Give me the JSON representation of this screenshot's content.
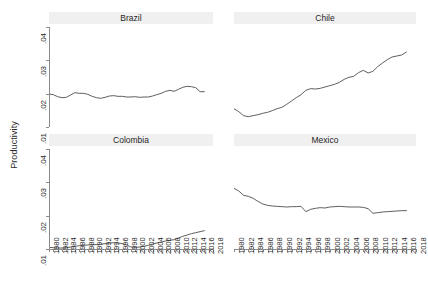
{
  "chart_data": {
    "type": "line",
    "title": "",
    "xlabel": "",
    "ylabel": "Productivity",
    "layout": "2x2 small multiples (faceted by country)",
    "grid": false,
    "legend": "none",
    "xlim": [
      1980,
      2018
    ],
    "ylim": [
      0.01,
      0.04
    ],
    "ytick_labels": [
      ".04",
      ".03",
      ".02",
      ".01"
    ],
    "ytick_values": [
      0.04,
      0.03,
      0.02,
      0.01
    ],
    "xtick_labels": [
      "1980",
      "1982",
      "1984",
      "1986",
      "1988",
      "1990",
      "1992",
      "1994",
      "1996",
      "1998",
      "2000",
      "2002",
      "2004",
      "2006",
      "2008",
      "2010",
      "2012",
      "2014",
      "2016",
      "2018"
    ],
    "x": [
      1980,
      1981,
      1982,
      1983,
      1984,
      1985,
      1986,
      1987,
      1988,
      1989,
      1990,
      1991,
      1992,
      1993,
      1994,
      1995,
      1996,
      1997,
      1998,
      1999,
      2000,
      2001,
      2002,
      2003,
      2004,
      2005,
      2006,
      2007,
      2008,
      2009,
      2010,
      2011,
      2012,
      2013,
      2014,
      2015,
      2016
    ],
    "panels": [
      {
        "name": "Brazil",
        "row": 0,
        "col": 0,
        "x": [
          1980,
          1981,
          1982,
          1983,
          1984,
          1985,
          1986,
          1987,
          1988,
          1989,
          1990,
          1991,
          1992,
          1993,
          1994,
          1995,
          1996,
          1997,
          1998,
          1999,
          2000,
          2001,
          2002,
          2003,
          2004,
          2005,
          2006,
          2007,
          2008,
          2009,
          2010,
          2011,
          2012,
          2013,
          2014,
          2015,
          2016
        ],
        "values": [
          0.0199,
          0.0197,
          0.0191,
          0.0188,
          0.0189,
          0.0196,
          0.0203,
          0.0201,
          0.0201,
          0.0198,
          0.0192,
          0.0188,
          0.0186,
          0.0189,
          0.0193,
          0.0194,
          0.0192,
          0.0192,
          0.019,
          0.019,
          0.0191,
          0.0189,
          0.019,
          0.019,
          0.0193,
          0.0197,
          0.0201,
          0.0207,
          0.021,
          0.0207,
          0.0213,
          0.0219,
          0.0222,
          0.0221,
          0.0218,
          0.0206,
          0.0206
        ]
      },
      {
        "name": "Chile",
        "row": 0,
        "col": 1,
        "x": [
          1980,
          1981,
          1982,
          1983,
          1984,
          1985,
          1986,
          1987,
          1988,
          1989,
          1990,
          1991,
          1992,
          1993,
          1994,
          1995,
          1996,
          1997,
          1998,
          1999,
          2000,
          2001,
          2002,
          2003,
          2004,
          2005,
          2006,
          2007,
          2008,
          2009,
          2010,
          2011,
          2012,
          2013,
          2014,
          2015,
          2016
        ],
        "values": [
          0.0155,
          0.0146,
          0.0134,
          0.0131,
          0.0134,
          0.0137,
          0.0141,
          0.0144,
          0.0149,
          0.0155,
          0.0159,
          0.0168,
          0.0178,
          0.0188,
          0.0197,
          0.021,
          0.0215,
          0.0214,
          0.0216,
          0.022,
          0.0224,
          0.0228,
          0.0234,
          0.0243,
          0.0249,
          0.0252,
          0.0263,
          0.027,
          0.0262,
          0.0267,
          0.0281,
          0.0292,
          0.0302,
          0.031,
          0.0313,
          0.0316,
          0.0325
        ]
      },
      {
        "name": "Colombia",
        "row": 1,
        "col": 0,
        "x": [
          1980,
          1981,
          1982,
          1983,
          1984,
          1985,
          1986,
          1987,
          1988,
          1989,
          1990,
          1991,
          1992,
          1993,
          1994,
          1995,
          1996,
          1997,
          1998,
          1999,
          2000,
          2001,
          2002,
          2003,
          2004,
          2005,
          2006,
          2007,
          2008,
          2009,
          2010,
          2011,
          2012,
          2013,
          2014,
          2015,
          2016
        ],
        "values": [
          0.0105,
          0.0104,
          0.0103,
          0.0103,
          0.0104,
          0.0106,
          0.0108,
          0.011,
          0.0111,
          0.0112,
          0.0113,
          0.0113,
          0.0114,
          0.0116,
          0.0118,
          0.0119,
          0.0118,
          0.0116,
          0.0112,
          0.0106,
          0.0105,
          0.0106,
          0.0108,
          0.0111,
          0.0115,
          0.0118,
          0.0121,
          0.0124,
          0.0126,
          0.0128,
          0.0133,
          0.0138,
          0.0142,
          0.0146,
          0.0149,
          0.0152,
          0.0155
        ]
      },
      {
        "name": "Mexico",
        "row": 1,
        "col": 1,
        "x": [
          1980,
          1981,
          1982,
          1983,
          1984,
          1985,
          1986,
          1987,
          1988,
          1989,
          1990,
          1991,
          1992,
          1993,
          1994,
          1995,
          1996,
          1997,
          1998,
          1999,
          2000,
          2001,
          2002,
          2003,
          2004,
          2005,
          2006,
          2007,
          2008,
          2009,
          2010,
          2011,
          2012,
          2013,
          2014,
          2015,
          2016
        ],
        "values": [
          0.0282,
          0.0274,
          0.0261,
          0.0258,
          0.0252,
          0.0243,
          0.0235,
          0.0231,
          0.0229,
          0.0228,
          0.0227,
          0.0226,
          0.0227,
          0.0227,
          0.0228,
          0.0212,
          0.0219,
          0.0222,
          0.0224,
          0.0223,
          0.0226,
          0.0227,
          0.0228,
          0.0227,
          0.0226,
          0.0226,
          0.0226,
          0.0225,
          0.0221,
          0.0207,
          0.0209,
          0.0211,
          0.0212,
          0.0213,
          0.0214,
          0.0215,
          0.0215
        ]
      }
    ],
    "line_color": "#4d4d4d",
    "strip_color": "#f0f0f0",
    "axis_color": "#8a8a8a",
    "background": "#ffffff"
  }
}
